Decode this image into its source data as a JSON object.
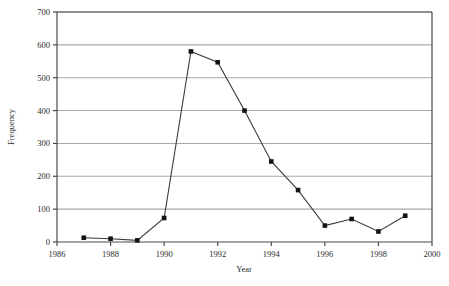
{
  "chart_data": {
    "type": "line",
    "title": "",
    "xlabel": "Year",
    "ylabel": "Frequency",
    "x": [
      1987,
      1988,
      1989,
      1990,
      1991,
      1992,
      1993,
      1994,
      1995,
      1996,
      1997,
      1998,
      1999
    ],
    "values": [
      13,
      10,
      5,
      73,
      580,
      547,
      400,
      245,
      158,
      50,
      70,
      32,
      80
    ],
    "series": [
      {
        "name": "Frequency",
        "x": [
          1987,
          1988,
          1989,
          1990,
          1991,
          1992,
          1993,
          1994,
          1995,
          1996,
          1997,
          1998,
          1999
        ],
        "values": [
          13,
          10,
          5,
          73,
          580,
          547,
          400,
          245,
          158,
          50,
          70,
          32,
          80
        ]
      }
    ],
    "xlim": [
      1986,
      2000
    ],
    "ylim": [
      0,
      700
    ],
    "xticks": [
      1986,
      1988,
      1990,
      1992,
      1994,
      1996,
      1998,
      2000
    ],
    "xtick_labels": [
      "1986",
      "1988",
      "1990",
      "1992",
      "1994",
      "1996",
      "1998",
      "2000"
    ],
    "yticks": [
      0,
      100,
      200,
      300,
      400,
      500,
      600,
      700
    ],
    "ytick_labels": [
      "0",
      "100",
      "200",
      "300",
      "400",
      "500",
      "600",
      "700"
    ],
    "grid": "horizontal",
    "legend": "none",
    "marker": "square",
    "line_color": "#3a3a3a",
    "marker_color": "#141414",
    "grid_color": "#a8a8a8",
    "axis_color": "#4a4a4a",
    "background": "#ffffff"
  }
}
